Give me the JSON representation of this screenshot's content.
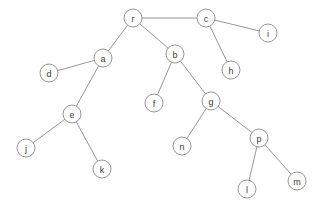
{
  "graph": {
    "title": "tree-diagram",
    "type": "node-link-tree",
    "node_radius": 9,
    "colors": {
      "background": "#ffffff",
      "node_fill": "#ffffff",
      "node_stroke": "#8a8a8a",
      "edge_stroke": "#8a8a8a",
      "label_text": "#3a3a3a"
    },
    "nodes": [
      {
        "id": "r",
        "label": "r",
        "x": 133,
        "y": 18
      },
      {
        "id": "c",
        "label": "c",
        "x": 206,
        "y": 18
      },
      {
        "id": "i",
        "label": "i",
        "x": 268,
        "y": 33
      },
      {
        "id": "h",
        "label": "h",
        "x": 231,
        "y": 70
      },
      {
        "id": "a",
        "label": "a",
        "x": 103,
        "y": 58
      },
      {
        "id": "b",
        "label": "b",
        "x": 175,
        "y": 54
      },
      {
        "id": "d",
        "label": "d",
        "x": 49,
        "y": 73
      },
      {
        "id": "e",
        "label": "e",
        "x": 72,
        "y": 114
      },
      {
        "id": "j",
        "label": "j",
        "x": 26,
        "y": 148
      },
      {
        "id": "k",
        "label": "k",
        "x": 102,
        "y": 169
      },
      {
        "id": "f",
        "label": "f",
        "x": 154,
        "y": 103
      },
      {
        "id": "g",
        "label": "g",
        "x": 211,
        "y": 101
      },
      {
        "id": "n",
        "label": "n",
        "x": 182,
        "y": 146
      },
      {
        "id": "p",
        "label": "p",
        "x": 259,
        "y": 138
      },
      {
        "id": "l",
        "label": "l",
        "x": 247,
        "y": 189
      },
      {
        "id": "m",
        "label": "m",
        "x": 297,
        "y": 181
      }
    ],
    "edges": [
      {
        "from": "r",
        "to": "c"
      },
      {
        "from": "r",
        "to": "a"
      },
      {
        "from": "r",
        "to": "b"
      },
      {
        "from": "c",
        "to": "i"
      },
      {
        "from": "c",
        "to": "h"
      },
      {
        "from": "a",
        "to": "d"
      },
      {
        "from": "a",
        "to": "e"
      },
      {
        "from": "e",
        "to": "j"
      },
      {
        "from": "e",
        "to": "k"
      },
      {
        "from": "b",
        "to": "f"
      },
      {
        "from": "b",
        "to": "g"
      },
      {
        "from": "g",
        "to": "n"
      },
      {
        "from": "g",
        "to": "p"
      },
      {
        "from": "p",
        "to": "l"
      },
      {
        "from": "p",
        "to": "m"
      }
    ]
  }
}
